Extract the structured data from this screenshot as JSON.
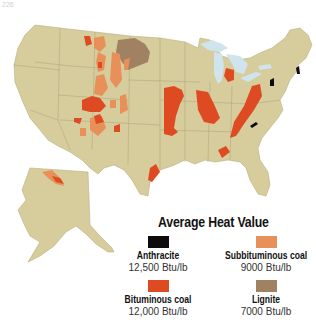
{
  "page_number": "226",
  "map": {
    "subject": "Coal deposits of the United States by type",
    "colors": {
      "land": "#d6cc9c",
      "water": "#cfe4ec",
      "border": "#9a9272",
      "background": "#ffffff"
    }
  },
  "legend": {
    "title": "Average Heat Value",
    "items": [
      {
        "name": "Anthracite",
        "value": "12,500 Btu/lb",
        "color": "#0d0b0b"
      },
      {
        "name": "Subbituminous coal",
        "value": "9000 Btu/lb",
        "color": "#e8905a"
      },
      {
        "name": "Bituminous coal",
        "value": "12,000 Btu/lb",
        "color": "#de4a22"
      },
      {
        "name": "Lignite",
        "value": "7000 Btu/lb",
        "color": "#a08262"
      }
    ]
  }
}
